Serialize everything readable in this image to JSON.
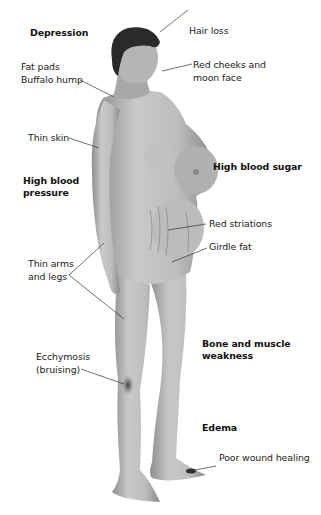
{
  "diagram": {
    "colors": {
      "skin": "#b9b9b9",
      "hair": "#2a2a2a",
      "bruise": "#4a4a4a",
      "leader": "#333333",
      "text": "#222222"
    },
    "labels": {
      "depression": "Depression",
      "hair_loss": "Hair loss",
      "fat_pads_1": "Fat pads",
      "fat_pads_2": "Buffalo hump",
      "red_cheeks_1": "Red cheeks and",
      "red_cheeks_2": "moon face",
      "thin_skin": "Thin skin",
      "high_bp_1": "High blood",
      "high_bp_2": "pressure",
      "high_sugar": "High blood sugar",
      "red_striations": "Red striations",
      "girdle_fat": "Girdle fat",
      "thin_limbs_1": "Thin arms",
      "thin_limbs_2": "and legs",
      "bone_1": "Bone and muscle",
      "bone_2": "weakness",
      "ecchymosis_1": "Ecchymosis",
      "ecchymosis_2": "(bruising)",
      "edema": "Edema",
      "wound": "Poor wound healing"
    }
  }
}
